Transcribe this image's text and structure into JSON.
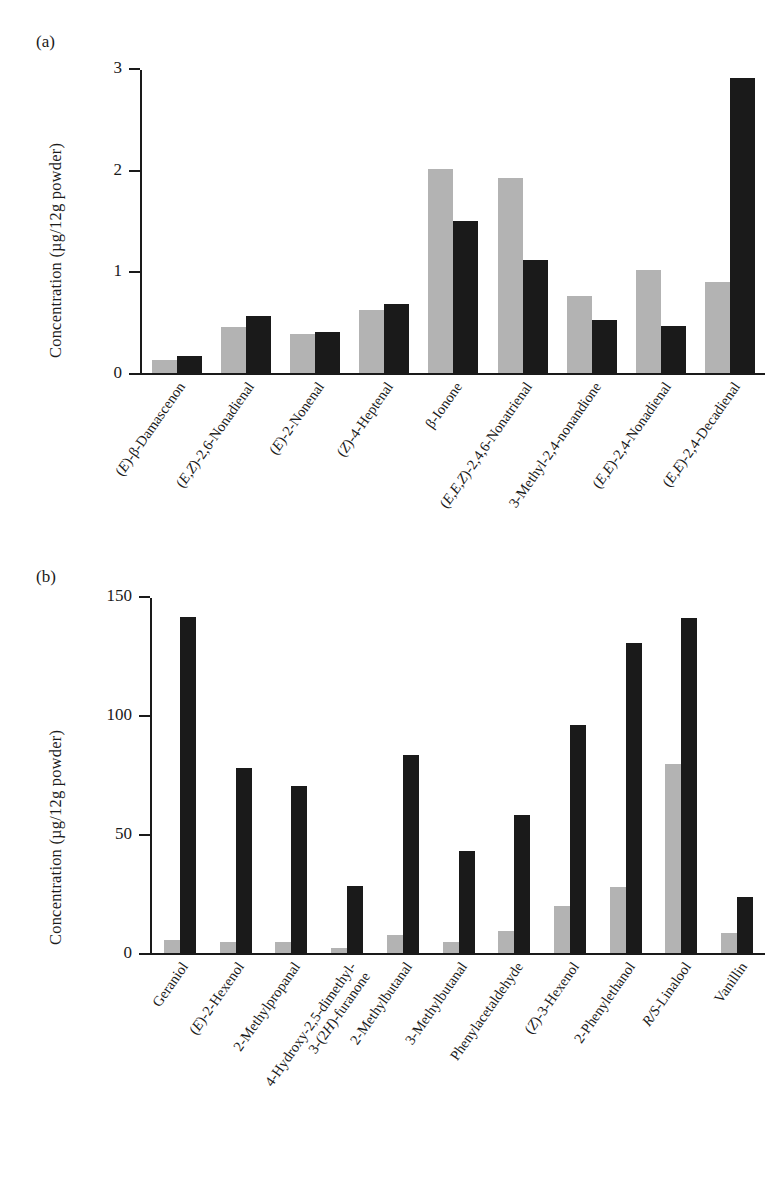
{
  "figure": {
    "panel_a_tag": "(a)",
    "panel_b_tag": "(b)",
    "y_axis_title": "Concentration (µg/12g powder)"
  },
  "chart_data": [
    {
      "type": "bar",
      "panel": "(a)",
      "title": "",
      "xlabel": "",
      "ylabel": "Concentration (µg/12g powder)",
      "ylim": [
        0,
        3
      ],
      "yticks": [
        "0",
        "1",
        "2",
        "3"
      ],
      "grid": false,
      "legend": "none",
      "colors": {
        "series1": "#b3b3b3",
        "series2": "#1a1a1a"
      },
      "categories": [
        "(E)-β-Damascenon",
        "(E,Z)-2,6-Nonadienal",
        "(E)-2-Nonenal",
        "(Z)-4-Heptenal",
        "β-Ionone",
        "(E,E,Z)-2,4,6-Nonatrienal",
        "3-Methyl-2,4-nonandione",
        "(E,E)-2,4-Nonadienal",
        "(E,E)-2,4-Decadienal"
      ],
      "series": [
        {
          "name": "series1",
          "values": [
            0.13,
            0.46,
            0.39,
            0.62,
            2.02,
            1.93,
            0.76,
            1.02,
            0.9
          ]
        },
        {
          "name": "series2",
          "values": [
            0.17,
            0.56,
            0.41,
            0.68,
            1.51,
            1.12,
            0.52,
            0.47,
            2.92
          ]
        }
      ]
    },
    {
      "type": "bar",
      "panel": "(b)",
      "title": "",
      "xlabel": "",
      "ylabel": "Concentration (µg/12g powder)",
      "ylim": [
        0,
        150
      ],
      "yticks": [
        "0",
        "50",
        "100",
        "150"
      ],
      "grid": false,
      "legend": "none",
      "colors": {
        "series1": "#b3b3b3",
        "series2": "#1a1a1a"
      },
      "categories": [
        "Geraniol",
        "(E)-2-Hexenol",
        "2-Methylpropanal",
        "4-Hydroxy-2,5-dimethyl-3-(2H)-furanone",
        "2-Methylbutanal",
        "3-Methylbutanal",
        "Phenylacetaldehyde",
        "(Z)-3-Hexenol",
        "2-Phenylethanol",
        "R/S-Linalool",
        "Vanillin"
      ],
      "series": [
        {
          "name": "series1",
          "values": [
            5.5,
            4.5,
            4.5,
            2.0,
            7.5,
            4.5,
            9.5,
            20.0,
            28.0,
            80.0,
            8.5
          ]
        },
        {
          "name": "series2",
          "values": [
            142.0,
            78.0,
            70.5,
            28.5,
            83.5,
            43.0,
            58.5,
            96.5,
            131.0,
            141.5,
            23.5
          ]
        }
      ]
    }
  ],
  "panel_a": {
    "tag": "(a)",
    "ylabel": "Concentration (µg/12g powder)",
    "yticks": [
      {
        "label": "3",
        "value": 3
      },
      {
        "label": "2",
        "value": 2
      },
      {
        "label": "1",
        "value": 1
      },
      {
        "label": "0",
        "value": 0
      }
    ],
    "categories": [
      {
        "line1_pre": "(",
        "line1_em": "E",
        "line1_post": ")-β-Damascenon",
        "label": "(E)-β-Damascenon"
      },
      {
        "line1_pre": "(",
        "line1_em": "E,Z",
        "line1_post": ")-2,6-Nonadienal",
        "label": "(E,Z)-2,6-Nonadienal"
      },
      {
        "line1_pre": "(",
        "line1_em": "E",
        "line1_post": ")-2-Nonenal",
        "label": "(E)-2-Nonenal"
      },
      {
        "line1_pre": "(",
        "line1_em": "Z",
        "line1_post": ")-4-Heptenal",
        "label": "(Z)-4-Heptenal"
      },
      {
        "line1_pre": "",
        "line1_em": "",
        "line1_post": "β-Ionone",
        "label": "β-Ionone"
      },
      {
        "line1_pre": "(",
        "line1_em": "E,E,Z",
        "line1_post": ")-2,4,6-Nonatrienal",
        "label": "(E,E,Z)-2,4,6-Nonatrienal"
      },
      {
        "line1_pre": "",
        "line1_em": "",
        "line1_post": "3-Methyl-2,4-nonandione",
        "label": "3-Methyl-2,4-nonandione"
      },
      {
        "line1_pre": "(",
        "line1_em": "E,E",
        "line1_post": ")-2,4-Nonadienal",
        "label": "(E,E)-2,4-Nonadienal"
      },
      {
        "line1_pre": "(",
        "line1_em": "E,E",
        "line1_post": ")-2,4-Decadienal",
        "label": "(E,E)-2,4-Decadienal"
      }
    ],
    "gray": [
      0.13,
      0.46,
      0.39,
      0.62,
      2.02,
      1.93,
      0.76,
      1.02,
      0.9
    ],
    "black": [
      0.17,
      0.56,
      0.41,
      0.68,
      1.51,
      1.12,
      0.52,
      0.47,
      2.92
    ]
  },
  "panel_b": {
    "tag": "(b)",
    "ylabel": "Concentration (µg/12g powder)",
    "yticks": [
      {
        "label": "150",
        "value": 150
      },
      {
        "label": "100",
        "value": 100
      },
      {
        "label": "50",
        "value": 50
      },
      {
        "label": "0",
        "value": 0
      }
    ],
    "categories": [
      {
        "line1_pre": "",
        "line1_em": "",
        "line1_post": "Geraniol",
        "line2": "",
        "label": "Geraniol"
      },
      {
        "line1_pre": "(",
        "line1_em": "E",
        "line1_post": ")-2-Hexenol",
        "line2": "",
        "label": "(E)-2-Hexenol"
      },
      {
        "line1_pre": "",
        "line1_em": "",
        "line1_post": "2-Methylpropanal",
        "line2": "",
        "label": "2-Methylpropanal"
      },
      {
        "line1_pre": "",
        "line1_em": "",
        "line1_post": "4-Hydroxy-2,5-dimethyl-",
        "line2": "3-(2H)-furanone",
        "label": "4-Hydroxy-2,5-dimethyl-3-(2H)-furanone"
      },
      {
        "line1_pre": "",
        "line1_em": "",
        "line1_post": "2-Methylbutanal",
        "line2": "",
        "label": "2-Methylbutanal"
      },
      {
        "line1_pre": "",
        "line1_em": "",
        "line1_post": "3-Methylbutanal",
        "line2": "",
        "label": "3-Methylbutanal"
      },
      {
        "line1_pre": "",
        "line1_em": "",
        "line1_post": "Phenylacetaldehyde",
        "line2": "",
        "label": "Phenylacetaldehyde"
      },
      {
        "line1_pre": "(",
        "line1_em": "Z",
        "line1_post": ")-3-Hexenol",
        "line2": "",
        "label": "(Z)-3-Hexenol"
      },
      {
        "line1_pre": "",
        "line1_em": "",
        "line1_post": "2-Phenylethanol",
        "line2": "",
        "label": "2-Phenylethanol"
      },
      {
        "line1_pre": "",
        "line1_em": "R/S",
        "line1_post": "-Linalool",
        "line2": "",
        "label": "R/S-Linalool"
      },
      {
        "line1_pre": "",
        "line1_em": "",
        "line1_post": "Vanillin",
        "line2": "",
        "label": "Vanillin"
      }
    ],
    "gray": [
      5.5,
      4.5,
      4.5,
      2.0,
      7.5,
      4.5,
      9.5,
      20.0,
      28.0,
      80.0,
      8.5
    ],
    "black": [
      142.0,
      78.0,
      70.5,
      28.5,
      83.5,
      43.0,
      58.5,
      96.5,
      131.0,
      141.5,
      23.5
    ]
  }
}
